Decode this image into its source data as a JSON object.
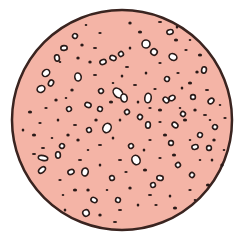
{
  "figure": {
    "description": "Circular cross-section with scattered pores/particles",
    "colors": {
      "background": "#ffffff",
      "fill": "#f4b4a6",
      "outline": "#3a2420",
      "pore_fill": "#ffffff",
      "pore_stroke": "#2a1a18",
      "dot": "#2a1a18"
    },
    "circle": {
      "cx": 122,
      "cy": 120,
      "r": 110
    },
    "pores": [
      [
        118,
        93,
        5,
        7
      ],
      [
        124,
        98,
        4,
        5
      ],
      [
        107,
        128,
        5,
        6
      ],
      [
        136,
        160,
        5,
        6
      ],
      [
        85,
        172,
        4,
        5
      ],
      [
        46,
        73,
        5,
        4
      ],
      [
        64,
        48,
        4,
        3
      ],
      [
        75,
        36,
        3,
        3
      ],
      [
        103,
        62,
        4,
        3
      ],
      [
        113,
        58,
        4,
        3
      ],
      [
        121,
        54,
        3,
        3
      ],
      [
        146,
        44,
        5,
        5
      ],
      [
        154,
        52,
        4,
        4
      ],
      [
        170,
        32,
        4,
        3
      ],
      [
        173,
        57,
        5,
        4
      ],
      [
        172,
        98,
        4,
        3
      ],
      [
        148,
        98,
        4,
        6
      ],
      [
        166,
        100,
        4,
        3
      ],
      [
        78,
        77,
        4,
        5
      ],
      [
        51,
        83,
        3,
        4
      ],
      [
        41,
        89,
        5,
        4
      ],
      [
        43,
        158,
        6,
        3
      ],
      [
        42,
        170,
        5,
        3
      ],
      [
        58,
        155,
        3,
        4
      ],
      [
        62,
        146,
        3,
        3
      ],
      [
        89,
        130,
        3,
        3
      ],
      [
        100,
        109,
        3,
        3
      ],
      [
        127,
        112,
        3,
        3
      ],
      [
        148,
        125,
        3,
        4
      ],
      [
        175,
        125,
        4,
        3
      ],
      [
        195,
        147,
        4,
        3
      ],
      [
        200,
        135,
        3,
        3
      ],
      [
        131,
        146,
        3,
        3
      ],
      [
        160,
        178,
        4,
        3
      ],
      [
        192,
        175,
        3,
        3
      ],
      [
        112,
        178,
        3,
        3
      ],
      [
        94,
        200,
        4,
        3
      ],
      [
        86,
        213,
        4,
        4
      ],
      [
        204,
        70,
        3,
        4
      ],
      [
        211,
        101,
        4,
        3
      ],
      [
        209,
        148,
        3,
        3
      ],
      [
        215,
        127,
        3,
        3
      ],
      [
        71,
        172,
        4,
        3
      ],
      [
        118,
        200,
        3,
        3
      ],
      [
        178,
        165,
        3,
        3
      ],
      [
        193,
        97,
        3,
        3
      ],
      [
        183,
        114,
        3,
        3
      ],
      [
        153,
        185,
        3,
        3
      ],
      [
        88,
        105,
        4,
        3
      ],
      [
        101,
        91,
        3,
        3
      ],
      [
        171,
        143,
        3,
        3
      ],
      [
        140,
        117,
        3,
        3
      ],
      [
        57,
        58,
        3,
        4
      ],
      [
        167,
        79,
        3,
        3
      ],
      [
        69,
        109,
        3,
        3
      ]
    ],
    "dots": [
      [
        86,
        25
      ],
      [
        130,
        23
      ],
      [
        160,
        22
      ],
      [
        177,
        27
      ],
      [
        100,
        33
      ],
      [
        140,
        32
      ],
      [
        190,
        40
      ],
      [
        82,
        45
      ],
      [
        95,
        48
      ],
      [
        130,
        48
      ],
      [
        186,
        50
      ],
      [
        200,
        55
      ],
      [
        60,
        62
      ],
      [
        90,
        62
      ],
      [
        127,
        67
      ],
      [
        146,
        73
      ],
      [
        178,
        73
      ],
      [
        190,
        83
      ],
      [
        113,
        83
      ],
      [
        72,
        90
      ],
      [
        135,
        85
      ],
      [
        182,
        88
      ],
      [
        155,
        89
      ],
      [
        160,
        110
      ],
      [
        180,
        108
      ],
      [
        195,
        110
      ],
      [
        205,
        115
      ],
      [
        120,
        120
      ],
      [
        160,
        122
      ],
      [
        185,
        120
      ],
      [
        210,
        120
      ],
      [
        96,
        120
      ],
      [
        75,
        125
      ],
      [
        58,
        120
      ],
      [
        40,
        123
      ],
      [
        34,
        135
      ],
      [
        52,
        138
      ],
      [
        78,
        140
      ],
      [
        100,
        145
      ],
      [
        113,
        138
      ],
      [
        150,
        140
      ],
      [
        165,
        135
      ],
      [
        190,
        140
      ],
      [
        214,
        140
      ],
      [
        120,
        160
      ],
      [
        144,
        150
      ],
      [
        160,
        158
      ],
      [
        174,
        155
      ],
      [
        200,
        160
      ],
      [
        222,
        165
      ],
      [
        80,
        160
      ],
      [
        100,
        165
      ],
      [
        60,
        180
      ],
      [
        75,
        190
      ],
      [
        107,
        190
      ],
      [
        130,
        188
      ],
      [
        150,
        195
      ],
      [
        170,
        196
      ],
      [
        190,
        190
      ],
      [
        208,
        185
      ],
      [
        63,
        195
      ],
      [
        88,
        190
      ],
      [
        120,
        210
      ],
      [
        138,
        205
      ],
      [
        156,
        205
      ],
      [
        175,
        208
      ],
      [
        195,
        200
      ],
      [
        100,
        215
      ],
      [
        115,
        222
      ],
      [
        65,
        210
      ],
      [
        46,
        108
      ],
      [
        30,
        112
      ],
      [
        220,
        105
      ],
      [
        197,
        72
      ],
      [
        207,
        90
      ],
      [
        138,
        102
      ],
      [
        150,
        108
      ],
      [
        111,
        102
      ],
      [
        66,
        98
      ],
      [
        78,
        58
      ],
      [
        95,
        75
      ],
      [
        122,
        76
      ],
      [
        160,
        63
      ],
      [
        176,
        40
      ],
      [
        224,
        150
      ],
      [
        56,
        100
      ],
      [
        43,
        148
      ],
      [
        212,
        160
      ],
      [
        126,
        172
      ],
      [
        145,
        170
      ],
      [
        88,
        150
      ],
      [
        68,
        135
      ],
      [
        34,
        154
      ],
      [
        23,
        130
      ],
      [
        225,
        118
      ]
    ]
  }
}
